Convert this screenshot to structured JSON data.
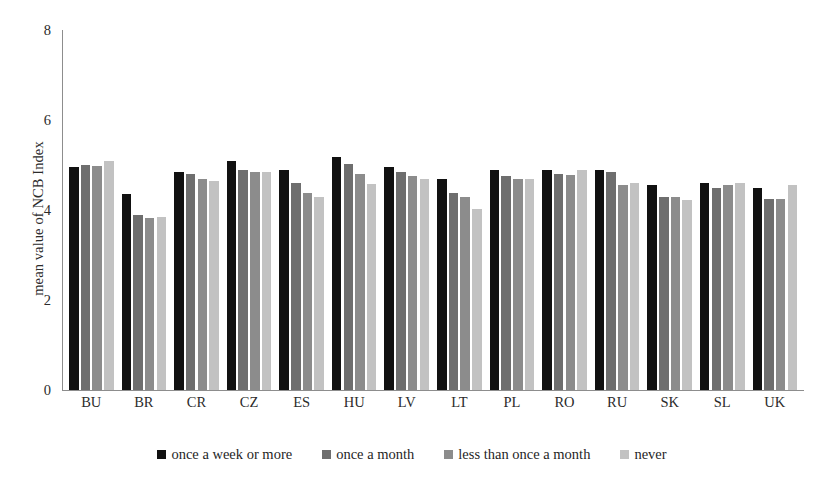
{
  "chart_data": {
    "type": "bar",
    "title": "",
    "xlabel": "",
    "ylabel": "mean value of NCB Index",
    "ylim": [
      0,
      8
    ],
    "yticks": [
      0,
      2,
      4,
      6,
      8
    ],
    "grid": false,
    "legend_position": "bottom",
    "categories": [
      "BU",
      "BR",
      "CR",
      "CZ",
      "ES",
      "HU",
      "LV",
      "LT",
      "PL",
      "RO",
      "RU",
      "SK",
      "SL",
      "UK"
    ],
    "series": [
      {
        "name": "once a week or more",
        "color": "#111111",
        "values": [
          4.95,
          4.35,
          4.85,
          5.08,
          4.9,
          5.18,
          4.95,
          4.7,
          4.88,
          4.88,
          4.88,
          4.55,
          4.6,
          4.48
        ]
      },
      {
        "name": "once a month",
        "color": "#6e6e6e",
        "values": [
          5.0,
          3.9,
          4.8,
          4.9,
          4.6,
          5.02,
          4.85,
          4.38,
          4.75,
          4.8,
          4.85,
          4.3,
          4.5,
          4.25
        ]
      },
      {
        "name": "less than once a month",
        "color": "#8c8c8c",
        "values": [
          4.98,
          3.82,
          4.7,
          4.85,
          4.38,
          4.8,
          4.75,
          4.28,
          4.7,
          4.78,
          4.55,
          4.28,
          4.55,
          4.25
        ]
      },
      {
        "name": "never",
        "color": "#c2c2c2",
        "values": [
          5.1,
          3.85,
          4.65,
          4.85,
          4.3,
          4.58,
          4.7,
          4.02,
          4.7,
          4.9,
          4.6,
          4.22,
          4.6,
          4.55
        ]
      }
    ]
  },
  "axis": {
    "y_label": "mean value of NCB Index",
    "y_ticks": [
      "0",
      "2",
      "4",
      "6",
      "8"
    ]
  },
  "legend": {
    "items": [
      {
        "label": "once a week or more"
      },
      {
        "label": "once a month"
      },
      {
        "label": "less than once a month"
      },
      {
        "label": "never"
      }
    ]
  },
  "top_clip": {
    "text": ""
  }
}
